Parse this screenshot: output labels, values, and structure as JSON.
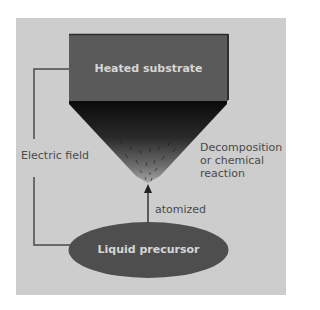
{
  "diagram": {
    "type": "process-schematic",
    "colors": {
      "background": "#ffffff",
      "panel": "#cdcdcd",
      "substrate_fill": "#5a5a5a",
      "substrate_border": "#333333",
      "funnel_top": "#0a0a0a",
      "funnel_bottom": "#8a8a8a",
      "precursor_fill": "#4e4e4e",
      "line": "#4a4a4a",
      "label_text": "#4a4a4a",
      "box_text": "#d6d6d6"
    },
    "nodes": {
      "substrate": {
        "label": "Heated substrate"
      },
      "precursor": {
        "label": "Liquid precursor"
      }
    },
    "annotations": {
      "electric_field": "Electric field",
      "reaction": {
        "line1": "Decomposition",
        "line2": "or chemical",
        "line3": "reaction"
      },
      "atomized": "atomized"
    },
    "edges": [
      {
        "from": "precursor",
        "to": "substrate",
        "label": "atomized",
        "style": "arrow"
      },
      {
        "from": "substrate",
        "to": "precursor",
        "label": "Electric field",
        "style": "bracket-line"
      }
    ]
  }
}
